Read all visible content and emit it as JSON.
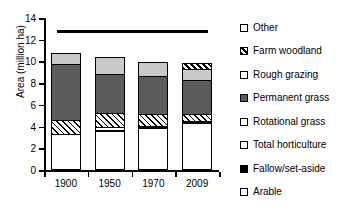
{
  "chart_data": {
    "type": "bar",
    "subtype": "stacked",
    "title": "",
    "xlabel": "",
    "ylabel": "Area (million ha)",
    "categories": [
      "1900",
      "1950",
      "1970",
      "2009"
    ],
    "ylim": [
      0,
      14
    ],
    "yticks": [
      0,
      2,
      4,
      6,
      8,
      10,
      12,
      14
    ],
    "grid": false,
    "legend_position": "right",
    "annotations": [
      {
        "type": "horizontal-rule",
        "y": 12.9,
        "x_start": 0.15,
        "x_end": 3.6,
        "color": "#000000"
      }
    ],
    "series": [
      {
        "name": "Arable",
        "key": "arable",
        "fill": "white",
        "values": [
          3.35,
          3.6,
          3.85,
          4.3
        ]
      },
      {
        "name": "Fallow/set-aside",
        "key": "fallow",
        "fill": "black",
        "values": [
          0.0,
          0.12,
          0.1,
          0.12
        ]
      },
      {
        "name": "Total horticulture",
        "key": "horti",
        "fill": "white",
        "values": [
          0.0,
          0.25,
          0.12,
          0.08
        ]
      },
      {
        "name": "Rotational grass",
        "key": "rotational",
        "fill": "hatch-thin",
        "values": [
          1.25,
          1.25,
          1.1,
          0.65
        ]
      },
      {
        "name": "Permanent grass",
        "key": "permanent",
        "fill": "dark-gray",
        "values": [
          5.2,
          3.6,
          3.45,
          3.15
        ]
      },
      {
        "name": "Rough grazing",
        "key": "rough",
        "fill": "light-gray",
        "values": [
          0.95,
          1.55,
          1.3,
          1.0
        ]
      },
      {
        "name": "Farm woodland",
        "key": "woodland",
        "fill": "hatch-bold",
        "values": [
          0.0,
          0.0,
          0.0,
          0.55
        ]
      },
      {
        "name": "Other",
        "key": "other",
        "fill": "white",
        "values": [
          0.0,
          0.0,
          0.0,
          0.0
        ]
      }
    ],
    "totals": [
      10.75,
      10.37,
      9.92,
      9.85
    ]
  },
  "axes": {
    "y_title": "Area (million ha)",
    "y_tick_labels": [
      "0",
      "2",
      "4",
      "6",
      "8",
      "10",
      "12",
      "14"
    ],
    "x_tick_labels": [
      "1900",
      "1950",
      "1970",
      "2009"
    ]
  },
  "legend": {
    "items": [
      {
        "label": "Other",
        "swatch": "white"
      },
      {
        "label": "Farm woodland",
        "swatch": "hatch-bold"
      },
      {
        "label": "Rough grazing",
        "swatch": "white"
      },
      {
        "label": "Permanent grass",
        "swatch": "dark-gray"
      },
      {
        "label": "Rotational grass",
        "swatch": "white"
      },
      {
        "label": "Total horticulture",
        "swatch": "white"
      },
      {
        "label": "Fallow/set-aside",
        "swatch": "black"
      },
      {
        "label": "Arable",
        "swatch": "white"
      }
    ]
  },
  "colors": {
    "axis": "#000000",
    "dark_gray": "#5b5b5b",
    "light_gray": "#c9c9c9",
    "white": "#ffffff",
    "black": "#000000"
  }
}
